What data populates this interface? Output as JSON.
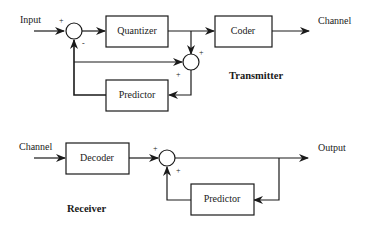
{
  "transmitter": {
    "title": "Transmitter",
    "input_label": "Input",
    "output_label": "Channel",
    "blocks": {
      "quantizer": "Quantizer",
      "coder": "Coder",
      "predictor": "Predictor"
    },
    "signs": {
      "sum1_input": "+",
      "sum1_feedback": "-",
      "sum2_top": "+",
      "sum2_left": "+"
    }
  },
  "receiver": {
    "title": "Receiver",
    "input_label": "Channel",
    "output_label": "Output",
    "blocks": {
      "decoder": "Decoder",
      "predictor": "Predictor"
    },
    "signs": {
      "sum_input": "+",
      "sum_feedback": "+"
    }
  }
}
